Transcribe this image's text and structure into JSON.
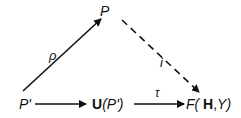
{
  "nodes": {
    "p": {
      "label": "P"
    },
    "p_prime": {
      "label": "P'"
    },
    "u_p_prime": {
      "bold": "U",
      "rest": "(P')"
    },
    "f_hy": {
      "f": "F(",
      "h": " H",
      "sep": ",",
      "y": "Y)"
    }
  },
  "edges": {
    "rho": {
      "label": "ρ",
      "style": "solid"
    },
    "i": {
      "label": "i",
      "style": "dashed"
    },
    "bottom_left": {
      "label": "",
      "style": "solid"
    },
    "tau": {
      "label": "τ",
      "style": "solid"
    }
  }
}
